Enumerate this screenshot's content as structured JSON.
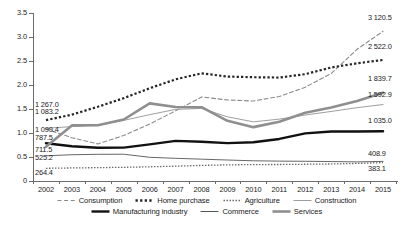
{
  "chart_data": {
    "type": "line",
    "title": "",
    "subtitle": "",
    "xlabel": "",
    "ylabel": "",
    "ylim": [
      0,
      3.5
    ],
    "yticks": [
      "0",
      "0.5",
      "1.0",
      "1.5",
      "2.0",
      "2.5",
      "3.0",
      "3.5"
    ],
    "ytick_values": [
      0,
      0.5,
      1.0,
      1.5,
      2.0,
      2.5,
      3.0,
      3.5
    ],
    "grid": false,
    "legend_position": "bottom",
    "categories": [
      2002,
      2003,
      2004,
      2005,
      2006,
      2007,
      2008,
      2009,
      2010,
      2011,
      2012,
      2013,
      2014,
      2015
    ],
    "x": [
      "2002",
      "2003",
      "2004",
      "2005",
      "2006",
      "2007",
      "2008",
      "2009",
      "2010",
      "2011",
      "2012",
      "2013",
      "2014",
      "2015"
    ],
    "series": [
      {
        "name": "Consumption",
        "style": "dashed",
        "color": "#8c8c8c",
        "width": 1.1,
        "values": [
          1.0832,
          0.902,
          0.773,
          0.949,
          1.186,
          1.462,
          1.751,
          1.688,
          1.666,
          1.761,
          1.953,
          2.24,
          2.745,
          3.1205
        ],
        "start_label": "1 083.2",
        "end_label": "3 120.5"
      },
      {
        "name": "Home purchase",
        "style": "dotted-thick",
        "color": "#262626",
        "width": 2.2,
        "values": [
          1.267,
          1.383,
          1.546,
          1.726,
          1.932,
          2.118,
          2.243,
          2.176,
          2.162,
          2.155,
          2.226,
          2.365,
          2.452,
          2.522
        ],
        "start_label": "1 267.0",
        "end_label": "2 522.0"
      },
      {
        "name": "Agriculture",
        "style": "dotted-fine",
        "color": "#6b6b6b",
        "width": 1.3,
        "values": [
          0.2644,
          0.272,
          0.278,
          0.285,
          0.296,
          0.309,
          0.325,
          0.336,
          0.342,
          0.344,
          0.349,
          0.355,
          0.366,
          0.3831
        ],
        "start_label": "264.4",
        "end_label": "383.1"
      },
      {
        "name": "Construction",
        "style": "solid-thin-gray",
        "color": "#9e9e9e",
        "width": 1.0,
        "values": [
          1.0994,
          1.133,
          1.166,
          1.262,
          1.382,
          1.492,
          1.512,
          1.337,
          1.233,
          1.289,
          1.375,
          1.449,
          1.528,
          1.5929
        ],
        "start_label": "1 099.4",
        "end_label": "1 592.9"
      },
      {
        "name": "Manufacturing industry",
        "style": "solid-thick-black",
        "color": "#111111",
        "width": 2.4,
        "values": [
          0.7875,
          0.724,
          0.692,
          0.695,
          0.763,
          0.836,
          0.818,
          0.789,
          0.806,
          0.876,
          0.992,
          1.032,
          1.031,
          1.035
        ],
        "start_label": "787.5",
        "end_label": "1 035.0"
      },
      {
        "name": "Commerce",
        "style": "solid-thin-dark",
        "color": "#555555",
        "width": 0.9,
        "values": [
          0.5252,
          0.547,
          0.556,
          0.558,
          0.494,
          0.473,
          0.455,
          0.437,
          0.421,
          0.414,
          0.411,
          0.405,
          0.398,
          0.4089
        ],
        "start_label": "525.2",
        "end_label": "408.9"
      },
      {
        "name": "Services",
        "style": "solid-thick-gray",
        "color": "#8f8f8f",
        "width": 2.6,
        "values": [
          0.7115,
          1.158,
          1.162,
          1.281,
          1.617,
          1.543,
          1.538,
          1.253,
          1.122,
          1.235,
          1.422,
          1.531,
          1.665,
          1.8397
        ],
        "start_label": "711.5",
        "end_label": "1 839.7"
      }
    ]
  },
  "axis": {
    "y_ticks": [
      "3.5",
      "3.0",
      "2.5",
      "2.0",
      "1.5",
      "1.0",
      "0.5",
      "0"
    ],
    "x_ticks": [
      "2002",
      "2003",
      "2004",
      "2005",
      "2006",
      "2007",
      "2008",
      "2009",
      "2010",
      "2011",
      "2012",
      "2013",
      "2014",
      "2015"
    ]
  },
  "value_labels": {
    "left": [
      {
        "text": "1 267.0",
        "series": "Home purchase"
      },
      {
        "text": "1 083.2",
        "series": "Consumption"
      },
      {
        "text": "1 099.4",
        "series": "Construction"
      },
      {
        "text": "787.5",
        "series": "Manufacturing industry"
      },
      {
        "text": "711.5",
        "series": "Services"
      },
      {
        "text": "525.2",
        "series": "Commerce"
      },
      {
        "text": "264.4",
        "series": "Agriculture"
      }
    ],
    "right": [
      {
        "text": "3 120.5",
        "series": "Consumption"
      },
      {
        "text": "2 522.0",
        "series": "Home purchase"
      },
      {
        "text": "1 839.7",
        "series": "Services"
      },
      {
        "text": "1 592.9",
        "series": "Construction"
      },
      {
        "text": "1 035.0",
        "series": "Manufacturing industry"
      },
      {
        "text": "408.9",
        "series": "Commerce"
      },
      {
        "text": "383.1",
        "series": "Agriculture"
      }
    ]
  },
  "legend": {
    "row1": [
      {
        "label": "Consumption",
        "icon": "dashed-line-swatch"
      },
      {
        "label": "Home purchase",
        "icon": "thick-dotted-line-swatch"
      },
      {
        "label": "Agriculture",
        "icon": "fine-dotted-line-swatch"
      },
      {
        "label": "Construction",
        "icon": "thin-gray-line-swatch"
      }
    ],
    "row2": [
      {
        "label": "Manufacturing industry",
        "icon": "thick-black-line-swatch"
      },
      {
        "label": "Commerce",
        "icon": "thin-dark-line-swatch"
      },
      {
        "label": "Services",
        "icon": "thick-gray-line-swatch"
      }
    ]
  },
  "colors": {
    "consumption": "#8c8c8c",
    "home_purchase": "#262626",
    "agriculture": "#6b6b6b",
    "construction": "#9e9e9e",
    "manufacturing": "#111111",
    "commerce": "#555555",
    "services": "#8f8f8f",
    "axis": "#6b6b6b",
    "background": "#ffffff"
  }
}
